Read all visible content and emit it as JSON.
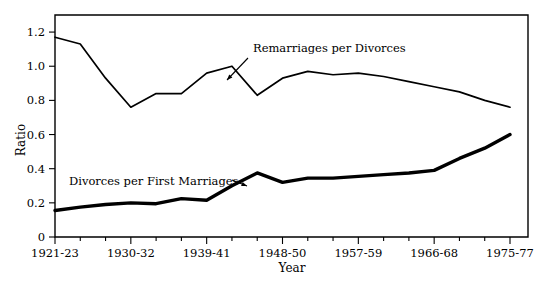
{
  "chart_data": {
    "type": "line",
    "title": "",
    "xlabel": "Year",
    "ylabel": "Ratio",
    "ylim": [
      0,
      1.3
    ],
    "yticks": [
      0,
      0.2,
      0.4,
      0.6,
      0.8,
      1.0,
      1.2
    ],
    "ytick_labels": [
      "0",
      "0.2",
      "0.4",
      "0.6",
      "0.8",
      "1.0",
      "1.2"
    ],
    "grid": false,
    "legend_position": "inline-annotations",
    "x_axis_type": "three-year-periods",
    "xtick_labels": [
      "1921-23",
      "1930-32",
      "1939-41",
      "1948-50",
      "1957-59",
      "1966-68",
      "1975-77"
    ],
    "xtick_label_indices": [
      0,
      3,
      6,
      9,
      12,
      15,
      18
    ],
    "x_minor_ticks": true,
    "x": [
      "1921-23",
      "1924-26",
      "1927-29",
      "1930-32",
      "1933-35",
      "1936-38",
      "1939-41",
      "1942-44",
      "1945-47",
      "1948-50",
      "1951-53",
      "1954-56",
      "1957-59",
      "1960-62",
      "1963-65",
      "1966-68",
      "1969-71",
      "1972-74",
      "1975-77"
    ],
    "series": [
      {
        "name": "Remarriages per Divorces",
        "style": "thin",
        "values": [
          1.17,
          1.13,
          0.93,
          0.76,
          0.84,
          0.84,
          0.96,
          1.0,
          0.83,
          0.93,
          0.97,
          0.95,
          0.96,
          0.94,
          0.91,
          0.88,
          0.85,
          0.8,
          0.76
        ]
      },
      {
        "name": "Divorces per First Marriages",
        "style": "thick",
        "values": [
          0.155,
          0.175,
          0.19,
          0.2,
          0.195,
          0.225,
          0.215,
          0.3,
          0.375,
          0.32,
          0.345,
          0.345,
          0.355,
          0.365,
          0.375,
          0.39,
          0.46,
          0.52,
          0.6
        ]
      }
    ],
    "annotations": [
      {
        "text": "Remarriages per Divorces",
        "series": "Remarriages per Divorces",
        "text_x": 253,
        "text_y": 52,
        "leader_from_x": 248,
        "leader_from_y": 58,
        "leader_to_x": 227,
        "leader_to_y": 80
      },
      {
        "text": "Divorces per First Marriages",
        "series": "Divorces per First Marriages",
        "text_x": 69,
        "text_y": 185,
        "leader_from_x": 232,
        "leader_from_y": 180,
        "leader_to_x": 247,
        "leader_to_y": 186
      }
    ],
    "colors": {
      "line": "#000000",
      "frame": "#000000",
      "background": "#ffffff",
      "text": "#000000"
    }
  }
}
